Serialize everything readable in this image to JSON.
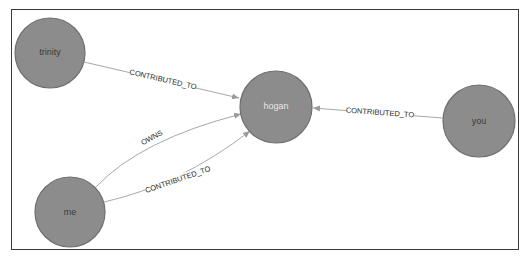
{
  "graph": {
    "nodes": [
      {
        "id": "trinity",
        "label": "trinity",
        "cx": 50,
        "cy": 53,
        "r": 35
      },
      {
        "id": "hogan",
        "label": "hogan",
        "cx": 276,
        "cy": 107,
        "r": 36
      },
      {
        "id": "you",
        "label": "you",
        "cx": 479,
        "cy": 121,
        "r": 36
      },
      {
        "id": "me",
        "label": "me",
        "cx": 70,
        "cy": 212,
        "r": 35
      }
    ],
    "edges": [
      {
        "from": "trinity",
        "to": "hogan",
        "label": "CONTRIBUTED_TO"
      },
      {
        "from": "you",
        "to": "hogan",
        "label": "CONTRIBUTED_TO"
      },
      {
        "from": "me",
        "to": "hogan",
        "label": "OWNS"
      },
      {
        "from": "me",
        "to": "hogan",
        "label": "CONTRIBUTED_TO"
      }
    ]
  },
  "colors": {
    "node_fill": "#8c8c8c",
    "node_stroke": "#6f6f6f",
    "edge": "#a8a8a8",
    "frame": "#3a3a3a"
  }
}
